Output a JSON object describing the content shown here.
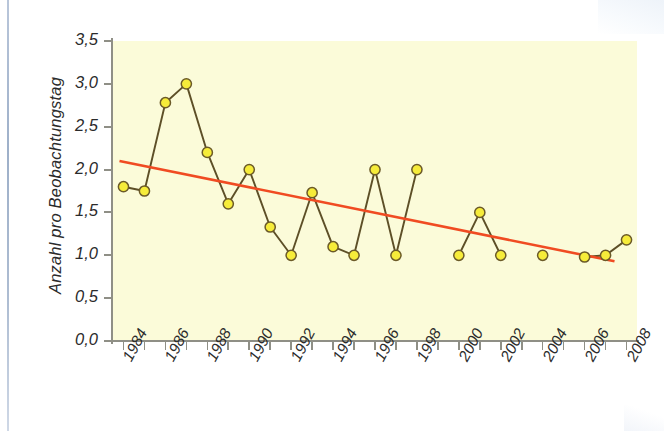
{
  "chart_data": {
    "type": "line",
    "title": "",
    "xlabel": "",
    "ylabel": "Anzahl pro Beobachtungstag",
    "xlim": [
      1983.5,
      2008.5
    ],
    "ylim": [
      0.0,
      3.5
    ],
    "grid": false,
    "legend": null,
    "y_ticks": [
      "0,0",
      "0,5",
      "1,0",
      "1,5",
      "2,0",
      "2,5",
      "3,0",
      "3,5"
    ],
    "y_tick_values": [
      0.0,
      0.5,
      1.0,
      1.5,
      2.0,
      2.5,
      3.0,
      3.5
    ],
    "x_tick_labels": [
      "1984",
      "1986",
      "1988",
      "1990",
      "1992",
      "1994",
      "1996",
      "1998",
      "2000",
      "2002",
      "2004",
      "2006",
      "2008"
    ],
    "x_tick_label_values": [
      1984,
      1986,
      1988,
      1990,
      1992,
      1994,
      1996,
      1998,
      2000,
      2002,
      2004,
      2006,
      2008
    ],
    "x_all_ticks": [
      1984,
      1985,
      1986,
      1987,
      1988,
      1989,
      1990,
      1991,
      1992,
      1993,
      1994,
      1995,
      1996,
      1997,
      1998,
      1999,
      2000,
      2001,
      2002,
      2003,
      2004,
      2005,
      2006,
      2007,
      2008
    ],
    "series": [
      {
        "name": "Anzahl pro Beobachtungstag",
        "marker": "circle",
        "marker_fill": "#f6ec3a",
        "marker_edge": "#6b5a28",
        "line_color": "#5d4f27",
        "x": [
          1984,
          1985,
          1986,
          1987,
          1988,
          1989,
          1990,
          1991,
          1992,
          1993,
          1994,
          1995,
          1996,
          1997,
          1998,
          2000,
          2001,
          2002,
          2004,
          2006,
          2007,
          2008
        ],
        "values": [
          1.8,
          1.75,
          2.78,
          3.0,
          2.2,
          1.6,
          2.0,
          1.33,
          1.0,
          1.73,
          1.1,
          1.0,
          2.0,
          1.0,
          2.0,
          1.0,
          1.5,
          1.0,
          1.0,
          0.98,
          1.0,
          1.18
        ],
        "gaps_after": [
          1998,
          2002,
          2004
        ]
      },
      {
        "name": "Trendlinie",
        "type": "trend",
        "line_color": "#f04b22",
        "x": [
          1984,
          2008
        ],
        "values": [
          2.1,
          0.93
        ]
      }
    ]
  },
  "colors": {
    "plot_background": "#fbfbd9",
    "page_background": "#ffffff",
    "axis": "#8f8f86",
    "text": "#2b2b2b",
    "marker_fill": "#f6ec3a",
    "marker_edge": "#6b5a28",
    "data_line": "#5d4f27",
    "trend_line": "#f04b22",
    "page_edge": "#9eb0c9"
  }
}
